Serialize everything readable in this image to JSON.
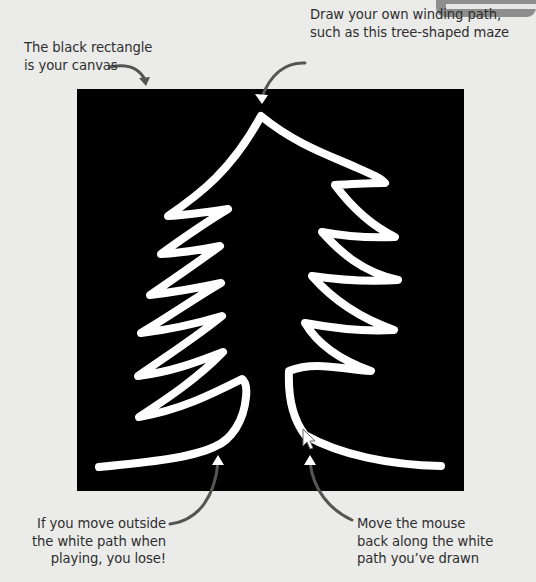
{
  "annotations": {
    "canvas_note": [
      "The black rectangle",
      "is your canvas"
    ],
    "path_note": [
      "Draw your own winding path,",
      "such as this tree-shaped maze"
    ],
    "lose_note": [
      "If you move outside",
      "the white path when",
      "playing, you lose!"
    ],
    "mouse_note": [
      "Move the mouse",
      "back along the white",
      "path you’ve drawn"
    ]
  },
  "canvas": {
    "background": "#000000",
    "path_color": "#ffffff",
    "shape": "tree-shaped maze"
  },
  "icons": {
    "cursor": "mouse-pointer-icon",
    "arrows": [
      "arrow-to-canvas",
      "arrow-to-path-start",
      "arrow-to-path-end",
      "arrow-to-cursor"
    ]
  },
  "colors": {
    "page_background": "#ebebea",
    "text": "#2e2e2e",
    "arrow": "#555555",
    "corner_tab": "#8e8e8e"
  }
}
